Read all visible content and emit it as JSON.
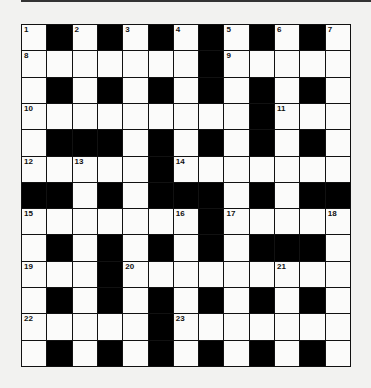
{
  "puzzle": {
    "type": "crossword",
    "rows": 13,
    "cols": 13,
    "pattern": [
      "WBWBWBWBWBWBW",
      "WWWWWWWBWWWWW",
      "WBWBWBWBWBWBW",
      "WWWWWWWWWBWWW",
      "WBBBWBWBWBWBW",
      "WWWWWBWWWWWWW",
      "BBWBWBBBWBWBB",
      "WWWWWWWBWWWWW",
      "WBWBWBWBWBBBW",
      "WWWBWWWWWWWWW",
      "WBWBWBWBWBWBW",
      "WWWWWBWWWWWWW",
      "WBWBWBWBWBWBW"
    ],
    "numbers": [
      {
        "row": 0,
        "col": 0,
        "n": "1"
      },
      {
        "row": 0,
        "col": 2,
        "n": "2"
      },
      {
        "row": 0,
        "col": 4,
        "n": "3"
      },
      {
        "row": 0,
        "col": 6,
        "n": "4"
      },
      {
        "row": 0,
        "col": 8,
        "n": "5"
      },
      {
        "row": 0,
        "col": 10,
        "n": "6"
      },
      {
        "row": 0,
        "col": 12,
        "n": "7"
      },
      {
        "row": 1,
        "col": 0,
        "n": "8"
      },
      {
        "row": 1,
        "col": 8,
        "n": "9"
      },
      {
        "row": 3,
        "col": 0,
        "n": "10"
      },
      {
        "row": 3,
        "col": 10,
        "n": "11"
      },
      {
        "row": 5,
        "col": 0,
        "n": "12"
      },
      {
        "row": 5,
        "col": 2,
        "n": "13"
      },
      {
        "row": 5,
        "col": 6,
        "n": "14"
      },
      {
        "row": 7,
        "col": 0,
        "n": "15"
      },
      {
        "row": 7,
        "col": 6,
        "n": "16"
      },
      {
        "row": 7,
        "col": 8,
        "n": "17"
      },
      {
        "row": 7,
        "col": 12,
        "n": "18"
      },
      {
        "row": 9,
        "col": 0,
        "n": "19"
      },
      {
        "row": 9,
        "col": 4,
        "n": "20"
      },
      {
        "row": 9,
        "col": 10,
        "n": "21"
      },
      {
        "row": 11,
        "col": 0,
        "n": "22"
      },
      {
        "row": 11,
        "col": 6,
        "n": "23"
      }
    ],
    "colors": {
      "background": "#f2f2f0",
      "block": "#000000",
      "cell": "#fbfbfa"
    }
  }
}
